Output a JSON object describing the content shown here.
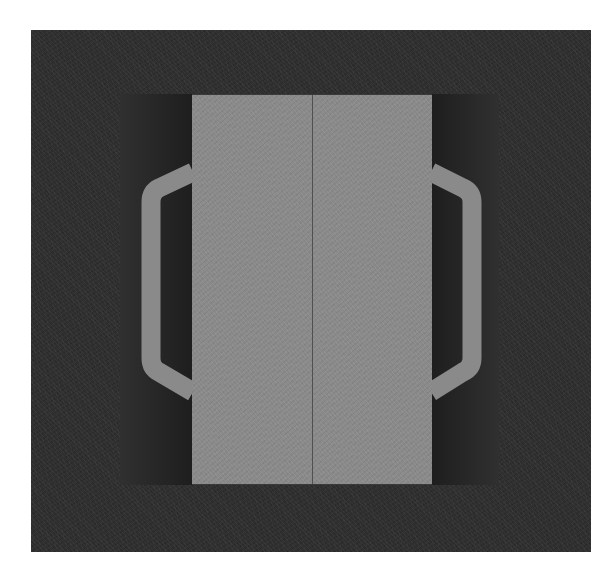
{
  "image": {
    "description": "Grayscale photograph of a rectangular object with two side handles, viewed from above against a dark background",
    "colors": {
      "background": "#2f2f2f",
      "inner_frame": "#262626",
      "panel": "#8a8a8a",
      "handle": "#8a8a8a",
      "seam": "#505050"
    }
  },
  "caption": {
    "text": ""
  }
}
